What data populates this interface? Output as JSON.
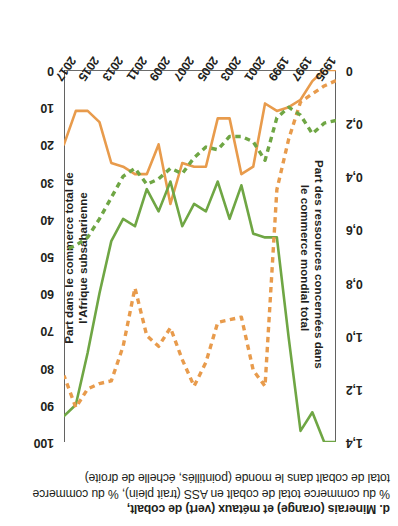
{
  "figure": {
    "caption_lines": [
      "d. Minerais (orange) et métaux (vert) de cobalt,",
      "% du commerce total de cobalt en ASS (trait plein), % du commerce",
      "total de cobalt dans le monde (pointillés, échelle de droite)"
    ],
    "colors": {
      "orange": "#E89B4C",
      "green": "#6FA644",
      "axis": "#3b3b3a",
      "text": "#231f20"
    }
  },
  "chart_data": {
    "type": "line",
    "title": "d. Minerais (orange) et métaux (vert) de cobalt, % du commerce total de cobalt en ASS (trait plein), % du commerce total de cobalt dans le monde (pointillés, échelle de droite)",
    "xlabel": "",
    "ylabel": "Part des ressources concernées dans le commerce mondial total",
    "y2label": "Part dans le commerce total de l'Afrique subsaharienne",
    "grid": false,
    "legend_position": "none",
    "ylim": [
      0,
      1.4
    ],
    "y2lim": [
      0,
      100
    ],
    "yticks": [
      "0",
      "0,2",
      "0,4",
      "0,6",
      "0,8",
      "1,0",
      "1,2",
      "1,4"
    ],
    "ytick_values": [
      0,
      0.2,
      0.4,
      0.6,
      0.8,
      1.0,
      1.2,
      1.4
    ],
    "y2ticks": [
      "0",
      "10",
      "20",
      "30",
      "40",
      "50",
      "60",
      "70",
      "80",
      "90",
      "100"
    ],
    "y2tick_values": [
      0,
      10,
      20,
      30,
      40,
      50,
      60,
      70,
      80,
      90,
      100
    ],
    "xticks": [
      "1995",
      "1997",
      "1999",
      "2001",
      "2003",
      "2005",
      "2007",
      "2009",
      "2011",
      "2013",
      "2015",
      "2017"
    ],
    "x": [
      1995,
      1996,
      1997,
      1998,
      1999,
      2000,
      2001,
      2002,
      2003,
      2004,
      2005,
      2006,
      2007,
      2008,
      2009,
      2010,
      2011,
      2012,
      2013,
      2014,
      2015,
      2016,
      2017,
      2018
    ],
    "series": [
      {
        "name": "Minerais de cobalt, % du commerce total de cobalt en ASS",
        "color": "#E89B4C",
        "style": "solid",
        "axis": "right",
        "values": [
          0,
          0,
          3,
          8,
          10,
          11,
          9,
          26,
          28,
          13,
          13,
          26,
          26,
          25,
          36,
          20,
          28,
          28,
          26,
          25,
          14,
          11,
          11,
          20
        ]
      },
      {
        "name": "Métaux de cobalt, % du commerce total de cobalt en ASS",
        "color": "#6FA644",
        "style": "solid",
        "axis": "right",
        "values": [
          100,
          100,
          92,
          97,
          72,
          45,
          45,
          44,
          31,
          40,
          30,
          38,
          36,
          42,
          30,
          38,
          32,
          42,
          40,
          46,
          60,
          76,
          90,
          93
        ]
      },
      {
        "name": "Minerais de cobalt, % du commerce total de cobalt dans le monde",
        "color": "#E89B4C",
        "style": "dashed",
        "axis": "left",
        "values": [
          0.04,
          0.06,
          0.09,
          0.12,
          0.26,
          0.45,
          1.19,
          1.13,
          0.93,
          0.94,
          0.95,
          1.1,
          1.19,
          1.09,
          0.97,
          1.04,
          1.0,
          0.82,
          1.04,
          1.17,
          1.18,
          1.2,
          1.27,
          1.15
        ]
      },
      {
        "name": "Métaux de cobalt, % du commerce total de cobalt dans le monde",
        "color": "#6FA644",
        "style": "dashed",
        "axis": "left",
        "values": [
          0.19,
          0.2,
          0.24,
          0.17,
          0.14,
          0.18,
          0.34,
          0.27,
          0.25,
          0.25,
          0.3,
          0.29,
          0.33,
          0.39,
          0.37,
          0.41,
          0.43,
          0.37,
          0.4,
          0.48,
          0.56,
          0.63,
          0.66,
          0.68
        ]
      }
    ]
  },
  "axes": {
    "left_title_lines": [
      "Part des ressources concernées dans",
      "le commerce mondial total"
    ],
    "right_title_lines": [
      "Part dans le commerce total de",
      "l'Afrique subsaharienne"
    ]
  }
}
